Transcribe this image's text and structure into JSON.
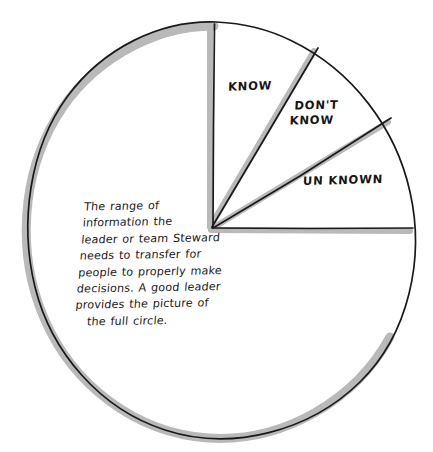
{
  "diagram": {
    "shape": "circle",
    "stroke_color": "#1a1a1a",
    "shadow_color": "#b9b9b9",
    "background_color": "#ffffff",
    "sectors": [
      {
        "id": "know",
        "label": "KNOW"
      },
      {
        "id": "dont-know",
        "label_line1": "DON'T",
        "label_line2": "KNOW"
      },
      {
        "id": "unknown",
        "label": "UN KNOWN"
      }
    ],
    "annotation": {
      "lines": [
        "The range of",
        "information the",
        "leader or team Steward",
        "needs to transfer for",
        "people to properly make",
        "decisions. A good leader",
        "provides the picture of",
        "the full circle."
      ]
    }
  }
}
